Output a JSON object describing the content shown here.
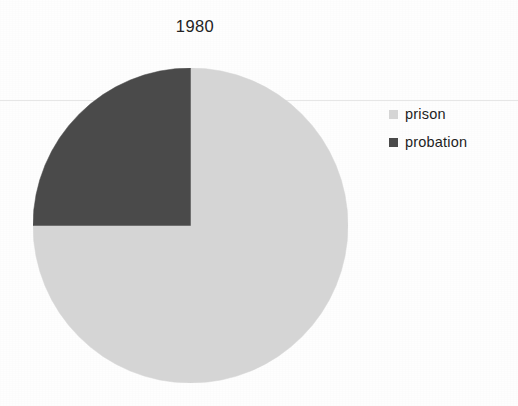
{
  "chart_data": {
    "type": "pie",
    "title": "1980",
    "xlabel": "",
    "ylabel": "",
    "legend_position": "right",
    "grid": false,
    "categories": [
      "prison",
      "probation"
    ],
    "values": [
      75,
      25
    ],
    "units": "percent",
    "slices": [
      {
        "label": "prison",
        "value": 75,
        "percent": "75%",
        "color": "#d5d5d5",
        "start_angle_deg": 0,
        "end_angle_deg": 270
      },
      {
        "label": "probation",
        "value": 25,
        "percent": "25%",
        "color": "#4a4a4a",
        "start_angle_deg": 270,
        "end_angle_deg": 360
      }
    ]
  },
  "title": {
    "text": "1980"
  },
  "legend": {
    "items": [
      {
        "label": "prison",
        "color": "#d5d5d5"
      },
      {
        "label": "probation",
        "color": "#4a4a4a"
      }
    ]
  },
  "colors": {
    "prison": "#d5d5d5",
    "probation": "#4a4a4a",
    "background": "#fefefe",
    "text": "#1f1f1f"
  }
}
